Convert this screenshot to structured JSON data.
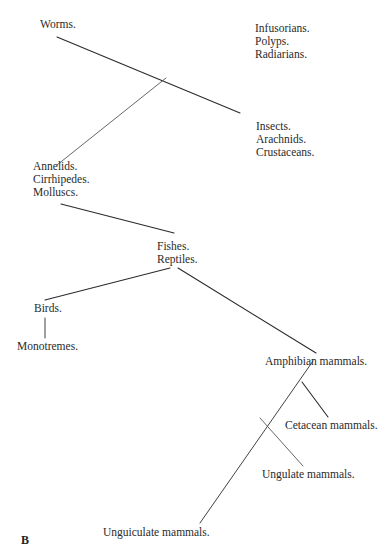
{
  "diagram": {
    "type": "branching tree",
    "panel_label": "B",
    "nodes": {
      "worms": {
        "lines": [
          "Worms."
        ]
      },
      "infusorians": {
        "lines": [
          "Infusorians.",
          "Polyps.",
          "Radiarians."
        ]
      },
      "insects": {
        "lines": [
          "Insects.",
          "Arachnids.",
          "Crustaceans."
        ]
      },
      "annelids": {
        "lines": [
          "Annelids.",
          "Cirrhipedes.",
          "Molluscs."
        ]
      },
      "fishes": {
        "lines": [
          "Fishes.",
          "Reptiles."
        ]
      },
      "birds": {
        "lines": [
          "Birds."
        ]
      },
      "monotremes": {
        "lines": [
          "Monotremes."
        ]
      },
      "amphibian": {
        "lines": [
          "Amphibian mammals."
        ]
      },
      "cetacean": {
        "lines": [
          "Cetacean mammals."
        ]
      },
      "ungulate": {
        "lines": [
          "Ungulate mammals."
        ]
      },
      "unguiculate": {
        "lines": [
          "Unguiculate mammals."
        ]
      }
    },
    "edges": [
      {
        "from": "Worms.",
        "to": "Insects. / Arachnids. / Crustaceans."
      },
      {
        "from": "Worms.",
        "to": "Annelids. / Cirrhipedes. / Molluscs."
      },
      {
        "from": "Annelids. / Cirrhipedes. / Molluscs.",
        "to": "Fishes. / Reptiles."
      },
      {
        "from": "Fishes. / Reptiles.",
        "to": "Birds."
      },
      {
        "from": "Fishes. / Reptiles.",
        "to": "Amphibian mammals."
      },
      {
        "from": "Birds.",
        "to": "Monotremes."
      },
      {
        "from": "Amphibian mammals.",
        "to": "Unguiculate mammals."
      },
      {
        "from": "Amphibian mammals.",
        "to": "Cetacean mammals."
      },
      {
        "from": "Amphibian mammals.",
        "to": "Ungulate mammals."
      }
    ]
  }
}
